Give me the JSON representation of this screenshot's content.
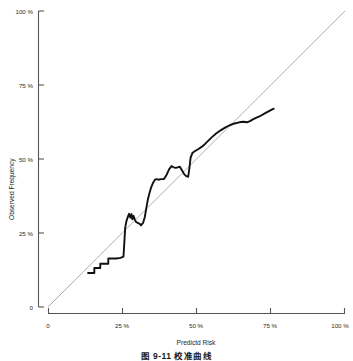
{
  "figure": {
    "caption": "图 9-11  校准曲线"
  },
  "chart_data": {
    "type": "line",
    "title": "",
    "xlabel": "Predictd Risk",
    "ylabel": "Observed Frequency",
    "xlim": [
      0,
      100
    ],
    "ylim": [
      0,
      100
    ],
    "grid": false,
    "legend": null,
    "xticks": [
      0,
      25,
      50,
      75,
      100
    ],
    "yticks": [
      0,
      25,
      50,
      75,
      100
    ],
    "xticklabels": [
      "0",
      "25 %",
      "50 %",
      "75 %",
      "100 %"
    ],
    "yticklabels": [
      "0",
      "25 %",
      "50 %",
      "75 %",
      "100 %"
    ],
    "series": [
      {
        "name": "Ideal (reference diagonal)",
        "style": "solid-thin-gray",
        "color": "#9a9a9a",
        "x": [
          0,
          100
        ],
        "y": [
          0,
          100
        ]
      },
      {
        "name": "Observed calibration curve",
        "style": "solid-thick-black",
        "color": "#111111",
        "x": [
          13.5,
          14.8,
          15.6,
          15.6,
          16.8,
          17.6,
          17.6,
          19.0,
          20.3,
          20.3,
          21.4,
          23.0,
          24.4,
          25.4,
          25.6,
          25.8,
          26.0,
          26.4,
          26.9,
          27.3,
          27.7,
          28.1,
          28.4,
          28.8,
          29.2,
          29.6,
          30.2,
          30.8,
          31.3,
          32.0,
          32.6,
          33.1,
          33.6,
          34.2,
          34.8,
          35.4,
          36.0,
          36.6,
          37.2,
          38.0,
          39.0,
          40.0,
          40.8,
          41.6,
          42.3,
          43.0,
          43.7,
          44.4,
          45.2,
          45.9,
          46.6,
          47.2,
          47.6,
          48.0,
          48.6,
          49.4,
          50.4,
          51.6,
          52.8,
          54.0,
          55.2,
          56.6,
          58.0,
          59.6,
          61.2,
          62.8,
          64.4,
          65.8,
          67.0,
          68.0,
          69.0,
          70.2,
          71.6,
          73.0,
          74.4,
          76.0
        ],
        "y": [
          11.5,
          11.5,
          11.5,
          13.2,
          13.2,
          13.2,
          14.6,
          14.6,
          14.6,
          16.4,
          16.4,
          16.4,
          16.6,
          17.0,
          20.0,
          23.5,
          26.8,
          29.0,
          30.5,
          31.5,
          30.2,
          31.4,
          29.6,
          30.8,
          29.6,
          28.8,
          28.4,
          28.2,
          27.6,
          28.4,
          30.4,
          33.4,
          36.2,
          38.6,
          40.6,
          42.0,
          43.0,
          43.2,
          43.0,
          43.2,
          43.2,
          44.8,
          46.6,
          47.6,
          47.2,
          47.0,
          47.2,
          47.4,
          46.0,
          44.8,
          44.2,
          44.0,
          46.8,
          50.4,
          52.0,
          52.6,
          53.2,
          54.0,
          55.0,
          56.2,
          57.4,
          58.6,
          59.6,
          60.6,
          61.4,
          62.0,
          62.4,
          62.6,
          62.4,
          62.8,
          63.4,
          64.0,
          64.6,
          65.4,
          66.2,
          67.0
        ]
      }
    ]
  }
}
